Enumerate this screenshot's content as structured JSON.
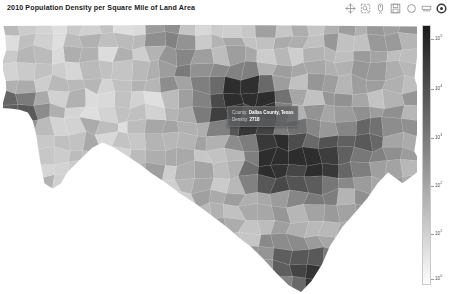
{
  "header": {
    "title": "2010 Population Density per Square Mile of Land Area",
    "toolbar": [
      {
        "name": "pan-tool",
        "label": "Pan"
      },
      {
        "name": "box-zoom-tool",
        "label": "Box Zoom"
      },
      {
        "name": "wheel-zoom-tool",
        "label": "Wheel Zoom"
      },
      {
        "name": "save-tool",
        "label": "Save"
      },
      {
        "name": "reset-tool",
        "label": "Reset"
      },
      {
        "name": "hover-tool",
        "label": "Hover"
      },
      {
        "name": "bokeh-logo",
        "label": "Bokeh"
      }
    ]
  },
  "tooltip": {
    "visible": true,
    "rows": [
      {
        "key": "County:",
        "value": "Dallas County, Texas"
      },
      {
        "key": "Density:",
        "value": "2718"
      }
    ]
  },
  "colorbar": {
    "orientation": "vertical",
    "scale": "log",
    "low_color": "#fcfcfc",
    "high_color": "#1b1b1b",
    "ticks": [
      {
        "label": "10",
        "exp": "5",
        "pos": 0.055
      },
      {
        "label": "10",
        "exp": "4",
        "pos": 0.245
      },
      {
        "label": "10",
        "exp": "3",
        "pos": 0.435
      },
      {
        "label": "10",
        "exp": "2",
        "pos": 0.62
      },
      {
        "label": "10",
        "exp": "1",
        "pos": 0.805
      },
      {
        "label": "10",
        "exp": "0",
        "pos": 0.975
      }
    ]
  },
  "chart_data": {
    "type": "heatmap",
    "title": "2010 Population Density per Square Mile of Land Area",
    "subtitle": "",
    "xlabel": "",
    "ylabel": "",
    "region": "Texas counties",
    "value_name": "Density",
    "value_units": "people per square mile",
    "color_scale": "log",
    "color_range": [
      1,
      100000
    ],
    "palette": "Greys256 (reversed: light = low, dark = high)",
    "legend_position": "right",
    "grid": false,
    "axes_visible": false,
    "highlighted_feature": {
      "County": "Dallas County, Texas",
      "Density": 2718
    }
  }
}
